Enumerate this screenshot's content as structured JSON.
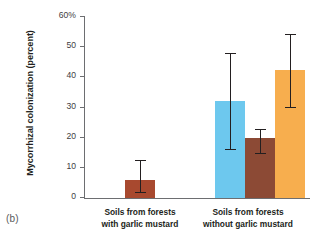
{
  "panel_label": "(b)",
  "chart_data": {
    "type": "bar",
    "title": "",
    "xlabel": "",
    "ylabel": "Mycorrhizal colonization (percent)",
    "ylim": [
      0,
      60
    ],
    "ytick_values": [
      0,
      10,
      20,
      30,
      40,
      50,
      60
    ],
    "ytick_labels": [
      "0",
      "10",
      "20",
      "30",
      "40",
      "50",
      "60%"
    ],
    "grid": false,
    "legend": "none",
    "categories": [
      "Soils from forests with garlic mustard",
      "Soils from forests without garlic mustard"
    ],
    "category_lines": [
      [
        "Soils from forests",
        "with garlic mustard"
      ],
      [
        "Soils from forests",
        "without garlic mustard"
      ]
    ],
    "bars": [
      {
        "group": 0,
        "index": 0,
        "value": 6,
        "err_low": 1.5,
        "err_high": 12.5,
        "color": "#a8492f"
      },
      {
        "group": 1,
        "index": 0,
        "value": 32,
        "err_low": 16,
        "err_high": 48,
        "color": "#6dc8ee"
      },
      {
        "group": 1,
        "index": 1,
        "value": 20,
        "err_low": 14.5,
        "err_high": 23,
        "color": "#8c4a35"
      },
      {
        "group": 1,
        "index": 2,
        "value": 42.5,
        "err_low": 30,
        "err_high": 54.5,
        "color": "#f7ae4e"
      }
    ],
    "colors": {
      "bar_red_brown": "#a8492f",
      "bar_light_blue": "#6dc8ee",
      "bar_dark_brown": "#8c4a35",
      "bar_orange": "#f7ae4e",
      "axis": "#6d6e71",
      "error_bar": "#231f20",
      "text": "#231f20"
    }
  }
}
